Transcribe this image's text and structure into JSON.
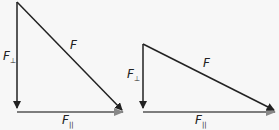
{
  "diagrams": [
    {
      "name": "steep-triangle",
      "labels": {
        "hypotenuse": "F",
        "vertical": "F",
        "vertical_sub": "⊥",
        "horizontal": "F",
        "horizontal_sub": "||"
      }
    },
    {
      "name": "shallow-triangle",
      "labels": {
        "hypotenuse": "F",
        "vertical": "F",
        "vertical_sub": "⊥",
        "horizontal": "F",
        "horizontal_sub": "||"
      }
    }
  ],
  "colors": {
    "line": "#222222",
    "arrow_gray": "#888888",
    "background": "#f7f7f7"
  }
}
